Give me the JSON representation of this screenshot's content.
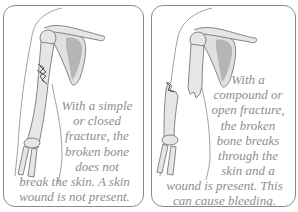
{
  "panels": [
    {
      "id": "simple-fracture",
      "caption_lines": [
        "With a simple",
        "or closed",
        "fracture, the",
        "broken bone",
        "does not",
        "break the skin. A skin",
        "wound is not present."
      ]
    },
    {
      "id": "compound-fracture",
      "caption_lines": [
        "With a",
        "compound or",
        "open fracture,",
        "the broken",
        "bone breaks",
        "through the",
        "skin and a",
        "wound is present. This",
        "can cause bleeding."
      ]
    }
  ],
  "colors": {
    "border": "#8a8a8a",
    "text": "#8e8e8e",
    "bone": "#e6e6e6",
    "bone_outline": "#6a6a6a",
    "scapula_shade": "#b5b5b5"
  }
}
